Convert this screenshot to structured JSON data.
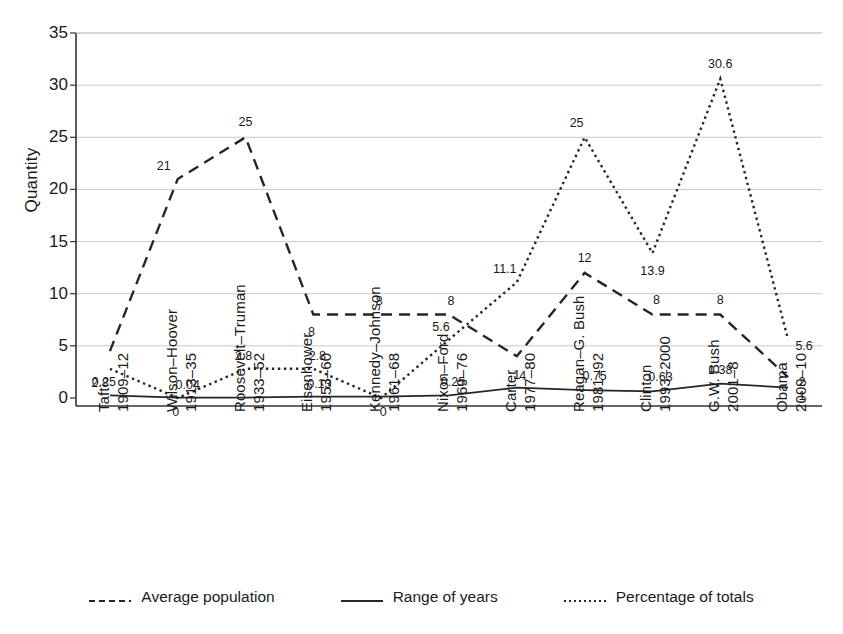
{
  "chart_data": {
    "type": "line",
    "title": "",
    "xlabel": "",
    "ylabel": "Quantity",
    "ylim": [
      0,
      35
    ],
    "yticks": [
      "0",
      "5",
      "10",
      "15",
      "20",
      "25",
      "30",
      "35"
    ],
    "grid": true,
    "legend_position": "bottom",
    "categories": [
      "Taft",
      "Wilson–Hoover",
      "Roosevelt–Truman",
      "Eisenhower",
      "Kennedy–Johnson",
      "Nixon–Ford",
      "Carter",
      "Reagan–G. Bush",
      "Clinton",
      "G.W. Bush",
      "Obama"
    ],
    "category_years": [
      "1909–12",
      "1913–35",
      "1933–52",
      "1953–60",
      "1961–68",
      "1969–76",
      "1977–80",
      "1981–92",
      "1993–2000",
      "2001–8",
      "2009–10"
    ],
    "series": [
      {
        "name": "Average population",
        "style": "dashed",
        "values": [
          4.5,
          21,
          25,
          8,
          8,
          8,
          4,
          12,
          8,
          8,
          2
        ],
        "labels": [
          "",
          "21",
          "25",
          "8",
          "8",
          "8",
          "4",
          "12",
          "8",
          "8",
          "2"
        ]
      },
      {
        "name": "Range of years",
        "style": "solid",
        "values": [
          0.25,
          0.04,
          0.04,
          0.13,
          0.13,
          0.25,
          1,
          0.75,
          0.63,
          1.38,
          1
        ],
        "labels": [
          "0.25",
          "0.04",
          "",
          "0.13",
          "",
          "0.25",
          "1",
          "0.75",
          "0.63",
          "1.38",
          "1"
        ]
      },
      {
        "name": "Percentage of totals",
        "style": "dotted",
        "values": [
          2.8,
          0,
          2.8,
          2.8,
          0,
          5.6,
          11.1,
          25,
          13.9,
          30.6,
          5.6
        ],
        "labels": [
          "2.8",
          "0",
          "2.8",
          "2.8",
          "0",
          "5.6",
          "11.1",
          "25",
          "13.9",
          "30.6",
          "5.6"
        ]
      }
    ]
  },
  "legend": {
    "items": [
      {
        "label": "Average population",
        "style": "dashed"
      },
      {
        "label": "Range of years",
        "style": "solid"
      },
      {
        "label": "Percentage of totals",
        "style": "dotted"
      }
    ]
  },
  "colors": {
    "line": "#262626",
    "grid": "#c9c9c9",
    "axis": "#333333",
    "background": "#ffffff"
  }
}
